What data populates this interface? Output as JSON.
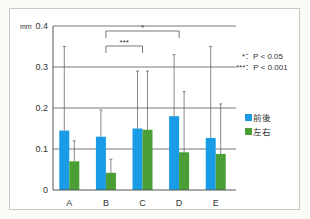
{
  "chart_data": {
    "type": "bar",
    "title": "",
    "xlabel": "",
    "ylabel": "mm",
    "ylim": [
      0,
      0.4
    ],
    "yticks": [
      "0",
      "0.1",
      "0.2",
      "0.3",
      "0.4"
    ],
    "grid": true,
    "categories": [
      "A",
      "B",
      "C",
      "D",
      "E"
    ],
    "series": [
      {
        "name": "前後",
        "color": "#1a9be6",
        "values": [
          0.145,
          0.13,
          0.15,
          0.18,
          0.127
        ],
        "error_upper": [
          0.35,
          0.195,
          0.29,
          0.33,
          0.35
        ]
      },
      {
        "name": "左右",
        "color": "#4a9e34",
        "values": [
          0.07,
          0.042,
          0.147,
          0.092,
          0.088
        ],
        "error_upper": [
          0.12,
          0.075,
          0.29,
          0.24,
          0.21
        ]
      }
    ],
    "significance": [
      {
        "from": "B",
        "to": "C",
        "label": "***"
      },
      {
        "from": "B",
        "to": "D",
        "label": "*"
      }
    ],
    "annotations": [
      "*：P < 0.05",
      "***：P < 0.001"
    ],
    "legend_position": "right"
  },
  "labels": {
    "unit": "mm",
    "note1": "*：P < 0.05",
    "note2": "***：P < 0.001",
    "legend1": "前後",
    "legend2": "左右",
    "sig1": "***",
    "sig2": "*"
  }
}
